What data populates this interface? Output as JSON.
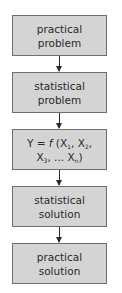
{
  "flowchart": {
    "steps": [
      {
        "line1": "practical",
        "line2": "problem"
      },
      {
        "line1": "statistical",
        "line2": "problem"
      },
      {
        "formula": {
          "lhs": "Y = ",
          "func": "f",
          "open": " (X",
          "s1": "1",
          "c1": ", X",
          "s2": "2",
          "c2": ",",
          "l2a": "X",
          "s3": "3",
          "l2b": ", ... X",
          "sn": "n",
          "close": ")"
        }
      },
      {
        "line1": "statistical",
        "line2": "solution"
      },
      {
        "line1": "practical",
        "line2": "solution"
      }
    ],
    "colors": {
      "box_fill": "#d4d4d4",
      "box_border": "#6e6e6e",
      "arrow": "#2a2a2a"
    }
  }
}
